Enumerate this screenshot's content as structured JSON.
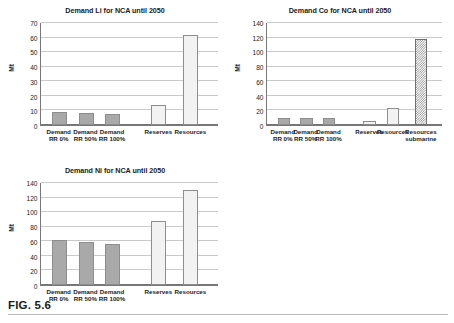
{
  "figure": {
    "caption": "FIG. 5.6"
  },
  "chart_data": [
    {
      "type": "bar",
      "id": "demand-li",
      "title": "Demand Li for NCA until 2050",
      "xlabel": "",
      "ylabel": "Mt",
      "ylim": [
        0,
        70
      ],
      "yticks": [
        0,
        10,
        20,
        30,
        40,
        50,
        60,
        70
      ],
      "grid": true,
      "legend": "none",
      "categories": [
        "Demand\nRR 0%",
        "Demand\nRR 50%",
        "Demand\nRR 100%",
        "Reserves",
        "Resources"
      ],
      "values": [
        9,
        8.5,
        7.8,
        14,
        61.5
      ],
      "styles": [
        "solid-gray",
        "solid-gray",
        "solid-gray",
        "light",
        "light"
      ]
    },
    {
      "type": "bar",
      "id": "demand-co",
      "title": "Demand Co for NCA until 2050",
      "xlabel": "",
      "ylabel": "Mt",
      "ylim": [
        0,
        140
      ],
      "yticks": [
        0,
        20,
        40,
        60,
        80,
        100,
        120,
        140
      ],
      "grid": true,
      "legend": "none",
      "categories": [
        "Demand\nRR 0%",
        "Demand\nRR 50%",
        "Demand\nRR 100%",
        "Reserves",
        "Resources",
        "Resources\nsubmarine"
      ],
      "values": [
        10,
        9.5,
        9,
        6,
        24,
        118
      ],
      "styles": [
        "solid-gray",
        "solid-gray",
        "solid-gray",
        "light",
        "light",
        "checker"
      ]
    },
    {
      "type": "bar",
      "id": "demand-ni",
      "title": "Demand Ni for NCA until 2050",
      "xlabel": "",
      "ylabel": "Mt",
      "ylim": [
        0,
        140
      ],
      "yticks": [
        0,
        20,
        40,
        60,
        80,
        100,
        120,
        140
      ],
      "grid": true,
      "legend": "none",
      "categories": [
        "Demand\nRR 0%",
        "Demand\nRR 50%",
        "Demand\nRR 100%",
        "Reserves",
        "Resources"
      ],
      "values": [
        62,
        59.5,
        56,
        88,
        130
      ],
      "styles": [
        "solid-gray",
        "solid-gray",
        "solid-gray",
        "light",
        "light"
      ]
    }
  ],
  "colors": {
    "bar_solid": "#a9a9a9",
    "bar_light": "#f2f2f2",
    "bar_outline": "#8d8d8d",
    "gridline": "#c9c9c9",
    "axis": "#777777",
    "text": "#1a1a1a"
  }
}
